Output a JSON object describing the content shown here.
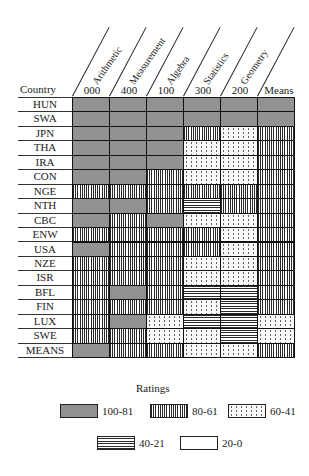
{
  "chart_data": {
    "type": "heatmap",
    "title": "",
    "row_header": "Country",
    "columns": [
      {
        "name": "Arithmetic",
        "code": "000"
      },
      {
        "name": "Measurement",
        "code": "400"
      },
      {
        "name": "Algebra",
        "code": "100"
      },
      {
        "name": "Statistics",
        "code": "300"
      },
      {
        "name": "Geometry",
        "code": "200"
      },
      {
        "name": "",
        "code": "Means"
      }
    ],
    "rows": [
      "HUN",
      "SWA",
      "JPN",
      "THA",
      "IRA",
      "CON",
      "NGE",
      "NTH",
      "CBC",
      "ENW",
      "USA",
      "NZE",
      "ISR",
      "BFL",
      "FIN",
      "LUX",
      "SWE",
      "MEANS"
    ],
    "values": [
      [
        "100-81",
        "100-81",
        "100-81",
        "100-81",
        "100-81",
        "100-81"
      ],
      [
        "100-81",
        "100-81",
        "100-81",
        "100-81",
        "100-81",
        "100-81"
      ],
      [
        "100-81",
        "100-81",
        "100-81",
        "80-61",
        "60-41",
        "80-61"
      ],
      [
        "100-81",
        "100-81",
        "100-81",
        "60-41",
        "60-41",
        "80-61"
      ],
      [
        "100-81",
        "100-81",
        "100-81",
        "60-41",
        "60-41",
        "80-61"
      ],
      [
        "100-81",
        "100-81",
        "80-61",
        "60-41",
        "60-41",
        "80-61"
      ],
      [
        "80-61",
        "80-61",
        "80-61",
        "80-61",
        "80-61",
        "80-61"
      ],
      [
        "100-81",
        "100-81",
        "80-61",
        "40-21",
        "80-61",
        "80-61"
      ],
      [
        "100-81",
        "80-61",
        "100-81",
        "60-41",
        "60-41",
        "80-61"
      ],
      [
        "80-61",
        "80-61",
        "80-61",
        "80-61",
        "60-41",
        "80-61"
      ],
      [
        "100-81",
        "80-61",
        "80-61",
        "80-61",
        "60-41",
        "80-61"
      ],
      [
        "80-61",
        "80-61",
        "80-61",
        "60-41",
        "60-41",
        "80-61"
      ],
      [
        "80-61",
        "80-61",
        "80-61",
        "60-41",
        "60-41",
        "80-61"
      ],
      [
        "80-61",
        "100-81",
        "80-61",
        "40-21",
        "40-21",
        "80-61"
      ],
      [
        "80-61",
        "80-61",
        "80-61",
        "60-41",
        "40-21",
        "80-61"
      ],
      [
        "80-61",
        "100-81",
        "60-41",
        "40-21",
        "40-21",
        "60-41"
      ],
      [
        "80-61",
        "80-61",
        "60-41",
        "60-41",
        "40-21",
        "60-41"
      ],
      [
        "100-81",
        "80-61",
        "80-61",
        "60-41",
        "60-41",
        "80-61"
      ]
    ],
    "legend": {
      "title": "Ratings",
      "placement": "bottom",
      "items": [
        {
          "label": "100-81",
          "pattern": "A"
        },
        {
          "label": "80-61",
          "pattern": "B"
        },
        {
          "label": "60-41",
          "pattern": "C"
        },
        {
          "label": "40-21",
          "pattern": "D"
        },
        {
          "label": "20-0",
          "pattern": "E"
        }
      ]
    }
  }
}
